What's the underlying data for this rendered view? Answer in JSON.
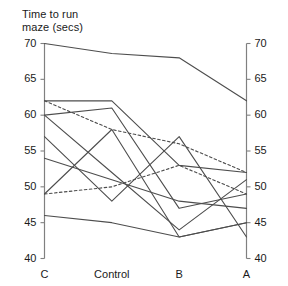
{
  "chart_data": {
    "type": "line",
    "title": "Time to run maze (secs)",
    "xlabel": "",
    "ylabel": "Time to run maze (secs)",
    "categories": [
      "C",
      "Control",
      "B",
      "A"
    ],
    "ylim": [
      40,
      70
    ],
    "yticks": [
      40,
      45,
      50,
      55,
      60,
      65,
      70
    ],
    "ytick_labels": [
      "40",
      "45",
      "50",
      "55",
      "60",
      "65",
      "70"
    ],
    "grid": false,
    "legend": "none",
    "axis_right_mirrored": true,
    "series": [
      {
        "name": "subject-1",
        "style": "solid",
        "values": [
          70,
          68.6,
          68,
          62
        ]
      },
      {
        "name": "subject-2",
        "style": "solid",
        "values": [
          62,
          62,
          53,
          52
        ]
      },
      {
        "name": "subject-3",
        "style": "dashed",
        "values": [
          62,
          58,
          56,
          52
        ]
      },
      {
        "name": "subject-4",
        "style": "solid",
        "values": [
          60,
          61,
          47,
          49
        ]
      },
      {
        "name": "subject-5",
        "style": "solid",
        "values": [
          60,
          52,
          44,
          51
        ]
      },
      {
        "name": "subject-6",
        "style": "solid",
        "values": [
          57,
          48,
          57,
          43
        ]
      },
      {
        "name": "subject-7",
        "style": "solid",
        "values": [
          54,
          51,
          48,
          47
        ]
      },
      {
        "name": "subject-8",
        "style": "dashed",
        "values": [
          49,
          50,
          53,
          49
        ]
      },
      {
        "name": "subject-9",
        "style": "solid",
        "values": [
          49,
          58,
          43,
          45
        ]
      },
      {
        "name": "subject-10",
        "style": "solid",
        "values": [
          46,
          45,
          43,
          45
        ]
      }
    ]
  },
  "axes": {
    "left_ticks": [
      "70",
      "65",
      "60",
      "55",
      "50",
      "45",
      "40"
    ],
    "right_ticks": [
      "70",
      "65",
      "60",
      "55",
      "50",
      "45",
      "40"
    ],
    "categories": [
      "C",
      "Control",
      "B",
      "A"
    ]
  },
  "title": {
    "text": "Time to run\nmaze (secs)"
  },
  "colors": {
    "line": "#4d4d4d",
    "axis": "#808080",
    "text": "#1a1a1a"
  }
}
